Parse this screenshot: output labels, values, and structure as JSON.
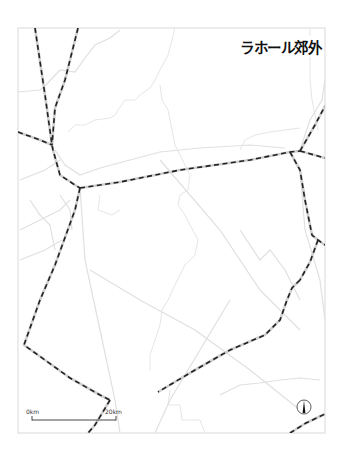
{
  "map": {
    "title": "ラホール郊外",
    "frame": {
      "x": 18,
      "y": 28,
      "width": 307,
      "height": 405,
      "stroke": "#d9d9d9"
    },
    "scale_bar": {
      "start_label": "0km",
      "end_label": "20km",
      "x1": 32,
      "x2": 116,
      "y": 420
    },
    "north_arrow": {
      "cx": 304,
      "cy": 407,
      "r": 7
    },
    "colors": {
      "railway": "#222222",
      "railway_casing": "#cfcfcf",
      "road": "#e0e0e0",
      "boundary": "#e6e6e6"
    },
    "railways": [
      "M35,28 L45,95 L52,145 L53,150 L60,175 L75,185 L80,188",
      "M78,28 L65,80 L55,108 L52,145",
      "M18,132 L40,140 L52,145",
      "M80,188 L75,210 L55,265 L40,300 L24,345 L45,360 L70,378 L100,395 L110,400",
      "M110,400 L95,425 L88,433",
      "M80,188 L120,182 L180,170 L250,160 L290,152 L300,151",
      "M300,151 L315,125 L325,106",
      "M300,151 L325,158",
      "M290,152 L300,170 L305,200 L312,235 L318,240 L325,245",
      "M318,240 L310,262 L300,280",
      "M300,280 L292,288 L287,300 L280,320 L265,335 L230,350 L195,370 L158,392",
      "M290,433 L306,423 L325,414"
    ],
    "roads": [
      "M18,92 L40,90 L45,86 L60,70 L75,72 L85,58 L95,45 L110,38 L120,30",
      "M20,180 L45,170 L60,160",
      "M20,230 L40,220 L60,210 L70,200",
      "M55,150 L65,165 L80,175 L100,168 L130,160 L160,152 L200,148 L250,145 L285,148",
      "M80,188 L85,260 L100,330 L115,400 L120,433",
      "M300,150 L310,120 L322,100 L325,80",
      "M90,270 L140,300 L195,330 L250,370 L300,410",
      "M160,160 L220,230 L260,290 L300,330",
      "M230,300 L200,350 L170,400 L155,433",
      "M300,170 L305,230 L320,280 L325,320",
      "M240,230 L260,260 L270,250 L285,270 L300,300",
      "M20,260 L45,250 L62,240",
      "M30,200 L40,215 L50,225 L55,250",
      "M60,195 L70,210 L72,230",
      "M220,395 L240,385 L260,383 L280,380 L300,378 L320,380"
    ],
    "boundaries": [
      "M175,28 L172,40 L168,55 L160,70 L155,80 L150,88 L140,95 L135,100 L125,100 L118,110 L115,115 L110,118 L95,120 L85,125 L75,125 L68,132",
      "M160,85 L162,100 L168,110 L172,130 L175,145 L180,155 L185,165 L190,175 L188,190 L180,195 L178,205 L185,215 L190,225 L198,240 L195,255 L185,265 L180,275 L175,285 L168,300 L162,310 L160,325 L155,340 L150,355 L150,370",
      "M100,195 L98,210 L112,215 L120,210",
      "M170,390 L168,405 L180,405 L182,420 L200,420 L205,433",
      "M310,28 L310,80 L312,100 L318,130",
      "M240,150 L245,140 L255,135 L270,132 L285,130 L300,128"
    ]
  }
}
